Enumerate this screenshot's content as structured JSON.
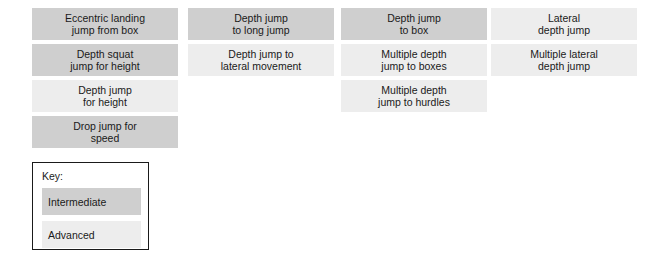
{
  "diagram": {
    "columns": [
      {
        "name": "column-1",
        "boxes": [
          {
            "label": "Eccentric landing\njump from box",
            "level": "intermediate"
          },
          {
            "label": "Depth squat\njump for height",
            "level": "intermediate"
          },
          {
            "label": "Depth jump\nfor height",
            "level": "advanced"
          },
          {
            "label": "Drop jump for\nspeed",
            "level": "intermediate"
          }
        ]
      },
      {
        "name": "column-2",
        "boxes": [
          {
            "label": "Depth jump\nto long jump",
            "level": "intermediate"
          },
          {
            "label": "Depth jump to\nlateral movement",
            "level": "advanced"
          }
        ]
      },
      {
        "name": "column-3",
        "boxes": [
          {
            "label": "Depth jump\nto box",
            "level": "intermediate"
          },
          {
            "label": "Multiple depth\njump to boxes",
            "level": "advanced"
          },
          {
            "label": "Multiple depth\njump to hurdles",
            "level": "advanced"
          }
        ]
      },
      {
        "name": "column-4",
        "boxes": [
          {
            "label": "Lateral\ndepth jump",
            "level": "advanced"
          },
          {
            "label": "Multiple lateral\ndepth jump",
            "level": "advanced"
          }
        ]
      }
    ]
  },
  "key": {
    "title": "Key:",
    "entries": [
      {
        "label": "Intermediate",
        "level": "intermediate"
      },
      {
        "label": "Advanced",
        "level": "advanced"
      }
    ]
  },
  "colors": {
    "intermediate": "#cfcfcf",
    "advanced": "#ededed",
    "text": "#1a1a1a",
    "background": "#ffffff",
    "key_border": "#1a1a1a"
  }
}
